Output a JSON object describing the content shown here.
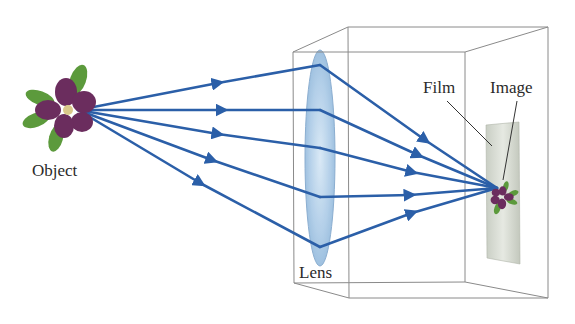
{
  "diagram": {
    "type": "camera-optics",
    "labels": {
      "object": "Object",
      "lens": "Lens",
      "film": "Film",
      "image": "Image"
    },
    "colors": {
      "ray": "#2b5fa8",
      "box_edge": "#8a8a8a",
      "lens_fill": "#a9c9e6",
      "lens_edge": "#7fa6cc",
      "film_fill": "#d4d9d0",
      "petal": "#6b2d5e",
      "leaf": "#5c9a3c",
      "text": "#2a2a2a"
    },
    "geometry": {
      "object_point": [
        78,
        110
      ],
      "focus_point": [
        497,
        188
      ],
      "lens_hits_y": [
        65,
        110,
        148,
        197,
        247
      ],
      "lens_x": 320
    }
  }
}
